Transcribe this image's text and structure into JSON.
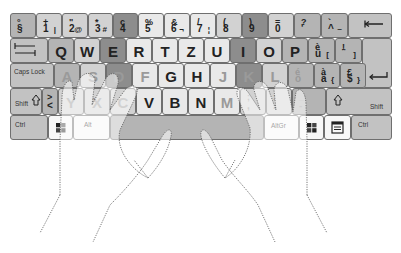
{
  "keyboard": {
    "layout": "German QWERTZ",
    "colors": {
      "dark": "#8d8d8d",
      "medium": "#b4b4b4",
      "light": "#d2d2d2",
      "extra_light": "#e9e9e9",
      "white": "#f7f7f7",
      "modifier": "#c2c2c2",
      "border": "#6f6f6f"
    },
    "number_row": [
      {
        "top": "°",
        "bottom": "§",
        "alt": ""
      },
      {
        "top": "+",
        "bottom": "1",
        "alt": "|"
      },
      {
        "top": "\"",
        "bottom": "2",
        "alt": "@"
      },
      {
        "top": "*",
        "bottom": "3",
        "alt": "#"
      },
      {
        "top": "ç",
        "bottom": "4",
        "alt": ""
      },
      {
        "top": "%",
        "bottom": "5",
        "alt": ""
      },
      {
        "top": "&",
        "bottom": "6",
        "alt": "¬"
      },
      {
        "top": "/",
        "bottom": "7",
        "alt": "¦"
      },
      {
        "top": "(",
        "bottom": "8",
        "alt": ""
      },
      {
        "top": ")",
        "bottom": "9",
        "alt": ""
      },
      {
        "top": "=",
        "bottom": "0",
        "alt": ""
      },
      {
        "top": "?",
        "bottom": "'",
        "alt": ""
      },
      {
        "top": "`",
        "bottom": "^",
        "alt": "~"
      }
    ],
    "backspace_icon": "backspace-arrow-icon",
    "tab_icon": "tab-arrows-icon",
    "top_row": [
      "Q",
      "W",
      "E",
      "R",
      "T",
      "Z",
      "U",
      "I",
      "O",
      "P"
    ],
    "top_row_extra": [
      {
        "top": "è",
        "bottom": "ü",
        "alt": "["
      },
      {
        "top": "!",
        "bottom": "¨",
        "alt": "]"
      }
    ],
    "caps_lock_label": "Caps Lock",
    "home_row": [
      "A",
      "S",
      "D",
      "F",
      "G",
      "H",
      "J",
      "K",
      "L"
    ],
    "home_row_extra": [
      {
        "top": "é",
        "bottom": "ö",
        "alt": ""
      },
      {
        "top": "à",
        "bottom": "ä",
        "alt": "{"
      },
      {
        "top": "£",
        "bottom": "$",
        "alt": "}"
      }
    ],
    "enter_icon": "enter-arrow-icon",
    "shift_label": "Shift",
    "shift_icon": "shift-arrow-icon",
    "angle_key": {
      "top": ">",
      "bottom": "<"
    },
    "bottom_row": [
      "Y",
      "X",
      "C",
      "V",
      "B",
      "N",
      "M"
    ],
    "bottom_row_extra": [
      {
        "top": ";",
        "bottom": ","
      },
      {
        "top": ":",
        "bottom": "."
      },
      {
        "top": "_",
        "bottom": "-"
      }
    ],
    "ctrl_label": "Ctrl",
    "alt_label": "Alt",
    "altgr_label": "AltGr",
    "windows_icon": "windows-logo-icon",
    "menu_icon": "context-menu-icon"
  },
  "hands": {
    "left": "left-hand-outline",
    "right": "right-hand-outline",
    "style": "dotted"
  }
}
